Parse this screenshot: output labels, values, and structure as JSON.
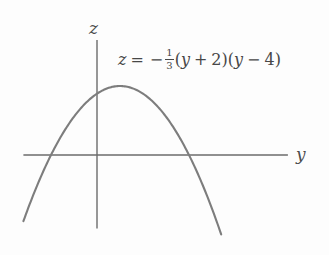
{
  "figure": {
    "background_color": "#fdfdfd",
    "axis_color": "#6b6b6b",
    "curve_color": "#7d7d7d",
    "text_color": "#474747",
    "axes": {
      "vertical_label": "z",
      "horizontal_label": "y"
    },
    "equation": {
      "lhs": "z",
      "equals": "=",
      "minus": "−",
      "fraction_numerator": "1",
      "fraction_denominator": "3",
      "factor1_open": "(",
      "factor1_var": "y",
      "factor1_op": "+",
      "factor1_const": "2",
      "factor1_close": ")",
      "factor2_open": "(",
      "factor2_var": "y",
      "factor2_op": "−",
      "factor2_const": "4",
      "factor2_close": ")",
      "plain_text": "z = -1/3(y + 2)(y - 4)"
    }
  },
  "chart_data": {
    "type": "line",
    "title": "",
    "subtitle": "",
    "xlabel": "y",
    "ylabel": "z",
    "grid": false,
    "legend": null,
    "annotations": [
      {
        "text": "z = -1/3(y + 2)(y - 4)",
        "position": "upper-right",
        "x_px": 118,
        "y_px": 48
      }
    ],
    "axis_origin_px": {
      "x": 97,
      "y": 155
    },
    "pixels_per_unit": 23,
    "xlim": [
      -3.2,
      8.3
    ],
    "ylim": [
      -3.2,
      5.0
    ],
    "curve": {
      "equation": "z = -(1/3)(y + 2)(y - 4)",
      "roots": [
        -2,
        4
      ],
      "vertex": {
        "y": 1,
        "z": 3
      },
      "leading_coefficient": -0.3333,
      "y_intercept": 2.6667,
      "domain_drawn": [
        -3.2,
        5.4
      ],
      "x": [
        -3.2,
        -2.8,
        -2.4,
        -2.0,
        -1.6,
        -1.2,
        -0.8,
        -0.4,
        0.0,
        0.4,
        0.8,
        1.0,
        1.2,
        1.6,
        2.0,
        2.4,
        2.8,
        3.2,
        3.6,
        4.0,
        4.4,
        4.8,
        5.2,
        5.4
      ],
      "z": [
        -2.88,
        -1.92,
        -1.02,
        0.0,
        0.75,
        1.44,
        2.08,
        2.64,
        2.67,
        2.99,
        2.91,
        3.0,
        2.91,
        2.56,
        2.0,
        1.28,
        0.43,
        -0.64,
        -1.65,
        0.0,
        -2.88,
        -4.48,
        -6.24,
        -7.25
      ]
    }
  }
}
